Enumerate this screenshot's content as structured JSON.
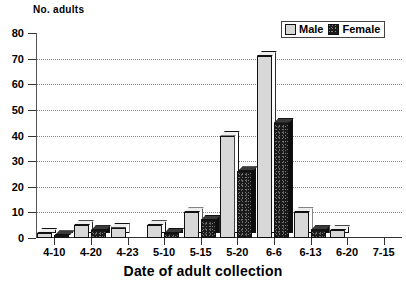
{
  "chart_data": {
    "type": "bar",
    "title": "",
    "xlabel": "Date of adult collection",
    "ylabel": "No. adults",
    "categories": [
      "4-10",
      "4-20",
      "4-23",
      "5-10",
      "5-15",
      "5-20",
      "6-6",
      "6-13",
      "6-20",
      "7-15"
    ],
    "series": [
      {
        "name": "Male",
        "color": "#d8d8d8",
        "values": [
          2,
          5,
          4,
          5,
          10,
          40,
          71,
          10,
          3,
          0
        ]
      },
      {
        "name": "Female",
        "color": "#1a1a1a",
        "values": [
          1,
          3,
          0,
          2,
          7,
          26,
          45,
          3,
          0,
          0
        ]
      }
    ],
    "ylim": [
      0,
      80
    ],
    "yticks": [
      0,
      10,
      20,
      30,
      40,
      50,
      60,
      70,
      80
    ],
    "ytick_labels": [
      "0",
      "10",
      "20",
      "30",
      "40",
      "50",
      "60",
      "70",
      "80"
    ],
    "grid": true,
    "grid_axis": "y",
    "legend_position": "top-right",
    "legend_entries": [
      "Male",
      "Female"
    ]
  },
  "axes": {
    "y_title": "No. adults",
    "x_title": "Date of adult collection"
  },
  "legend": {
    "male_label": "Male",
    "female_label": "Female"
  }
}
